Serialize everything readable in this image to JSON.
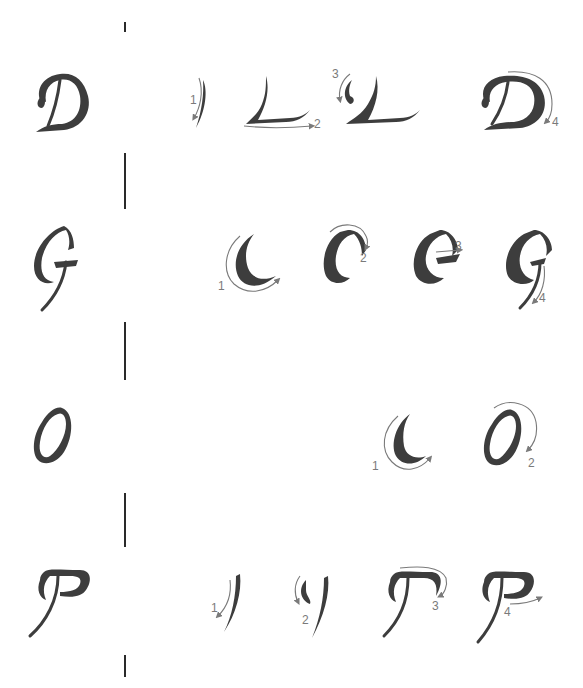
{
  "diagram": {
    "colors": {
      "ink": "#3d3d3d",
      "arrow": "#7a7a7a",
      "divider": "#2a2a2a",
      "background": "#ffffff"
    },
    "rows": [
      {
        "letter": "D",
        "steps": [
          {
            "number": "1",
            "shape": "vertical stem"
          },
          {
            "number": "2",
            "shape": "base stroke (L)"
          },
          {
            "number": "3",
            "shape": "left hook"
          },
          {
            "number": "4",
            "shape": "top bowl"
          }
        ]
      },
      {
        "letter": "G",
        "steps": [
          {
            "number": "1",
            "shape": "left curve (C)"
          },
          {
            "number": "2",
            "shape": "top arch"
          },
          {
            "number": "3",
            "shape": "cross bar"
          },
          {
            "number": "4",
            "shape": "descender tail"
          }
        ]
      },
      {
        "letter": "O",
        "steps": [
          {
            "number": "1",
            "shape": "left curve (C)"
          },
          {
            "number": "2",
            "shape": "right closing curve"
          }
        ]
      },
      {
        "letter": "P",
        "steps": [
          {
            "number": "1",
            "shape": "vertical stem"
          },
          {
            "number": "2",
            "shape": "left hook"
          },
          {
            "number": "3",
            "shape": "top arch"
          },
          {
            "number": "4",
            "shape": "bowl closing stroke"
          }
        ]
      }
    ],
    "dividers": [
      {
        "top": 22,
        "height": 10
      },
      {
        "top": 153,
        "height": 56
      },
      {
        "top": 322,
        "height": 58
      },
      {
        "top": 493,
        "height": 54
      },
      {
        "top": 655,
        "height": 22
      }
    ]
  }
}
